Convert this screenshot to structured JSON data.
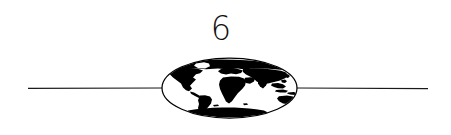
{
  "page": {
    "width": 451,
    "height": 135,
    "background_color": "#ffffff",
    "ink_color": "#000000"
  },
  "page_number": {
    "label": "6"
  },
  "divider": {
    "name": "horizontal-rule",
    "y": 88,
    "left_start_x": 28,
    "left_end_x": 162,
    "right_start_x": 297,
    "right_end_x": 428,
    "stroke_width": 1.1,
    "color": "#1a1a1a"
  },
  "globe": {
    "name": "globe-ellipse",
    "center_x": 229.5,
    "center_y": 88,
    "radius_x": 67.5,
    "radius_y": 30,
    "outline_color": "#000000",
    "outline_width": 1.2,
    "fill_color": "#ffffff",
    "landmass_color": "#000000",
    "projection": "oval-world-map",
    "continents": [
      "North America",
      "South America",
      "Europe",
      "Africa",
      "Asia",
      "Australia",
      "Antarctica",
      "Greenland"
    ]
  }
}
